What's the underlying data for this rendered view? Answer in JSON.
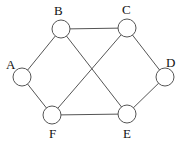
{
  "graph": {
    "node_radius": 9,
    "nodes": [
      {
        "id": "A",
        "label": "A",
        "x": 22,
        "y": 77,
        "lx": 6,
        "ly": 69
      },
      {
        "id": "B",
        "label": "B",
        "x": 61,
        "y": 29,
        "lx": 54,
        "ly": 15
      },
      {
        "id": "C",
        "label": "C",
        "x": 127,
        "y": 28,
        "lx": 122,
        "ly": 14
      },
      {
        "id": "D",
        "label": "D",
        "x": 165,
        "y": 77,
        "lx": 166,
        "ly": 67
      },
      {
        "id": "E",
        "label": "E",
        "x": 127,
        "y": 114,
        "lx": 123,
        "ly": 138
      },
      {
        "id": "F",
        "label": "F",
        "x": 52,
        "y": 115,
        "lx": 49,
        "ly": 138
      }
    ],
    "edges": [
      {
        "from": "A",
        "to": "B"
      },
      {
        "from": "B",
        "to": "C"
      },
      {
        "from": "C",
        "to": "D"
      },
      {
        "from": "D",
        "to": "E"
      },
      {
        "from": "E",
        "to": "F"
      },
      {
        "from": "F",
        "to": "A"
      },
      {
        "from": "B",
        "to": "E"
      },
      {
        "from": "C",
        "to": "F"
      }
    ]
  }
}
